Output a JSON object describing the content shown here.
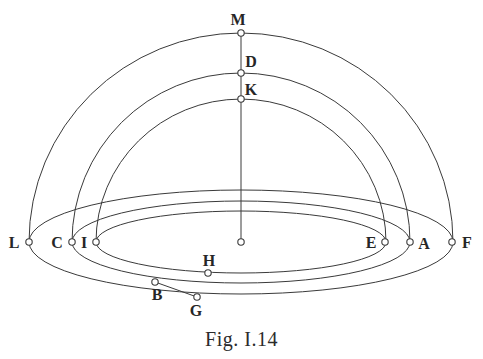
{
  "figure": {
    "caption": "Fig. I.14",
    "type": "geometric-diagram",
    "background_color": "#ffffff",
    "stroke_color": "#3a3a3a",
    "label_color": "#262626",
    "stroke_width": 1,
    "center": {
      "x": 241,
      "y": 242
    },
    "marker": {
      "radius": 3.2,
      "fill": "#ffffff",
      "stroke": "#3a3a3a",
      "stroke_width": 1.1
    },
    "ellipses": [
      {
        "name": "outer-horizon-ellipse",
        "cx": 241,
        "cy": 242,
        "rx": 212,
        "ry": 52
      },
      {
        "name": "middle-horizon-ellipse",
        "cx": 241,
        "cy": 242,
        "rx": 169,
        "ry": 41
      },
      {
        "name": "inner-horizon-ellipse",
        "cx": 241,
        "cy": 242,
        "rx": 145,
        "ry": 31
      }
    ],
    "arcs": [
      {
        "name": "outer-meridian-arc",
        "from": "L",
        "apex": "M",
        "to": "F",
        "cx": 241,
        "cy": 242,
        "r": 209,
        "rx": 212
      },
      {
        "name": "middle-meridian-arc",
        "from": "C",
        "apex": "D",
        "to": "A",
        "cx": 241,
        "cy": 242,
        "r": 169,
        "rx": 169
      },
      {
        "name": "inner-meridian-arc",
        "from": "I",
        "apex": "K",
        "to": "E",
        "cx": 241,
        "cy": 242,
        "r": 143,
        "rx": 145
      }
    ],
    "axis_line": {
      "name": "zenith-axis",
      "x": 241,
      "y1": 33,
      "y2": 242
    },
    "connector_lines": [
      {
        "name": "connector-b-g",
        "x1": 155,
        "y1": 282,
        "x2": 197,
        "y2": 297
      }
    ],
    "points": [
      {
        "id": "M",
        "label": "M",
        "x": 241,
        "y": 33,
        "label_x": 238,
        "label_y": 20
      },
      {
        "id": "D",
        "label": "D",
        "x": 241,
        "y": 73,
        "label_x": 251,
        "label_y": 62
      },
      {
        "id": "K",
        "label": "K",
        "x": 241,
        "y": 99,
        "label_x": 251,
        "label_y": 90
      },
      {
        "id": "O",
        "label": "",
        "x": 241,
        "y": 242,
        "label_x": 241,
        "label_y": 242
      },
      {
        "id": "L",
        "label": "L",
        "x": 29,
        "y": 242,
        "label_x": 14,
        "label_y": 243
      },
      {
        "id": "C",
        "label": "C",
        "x": 72,
        "y": 242,
        "label_x": 57,
        "label_y": 243
      },
      {
        "id": "I",
        "label": "I",
        "x": 96,
        "y": 242,
        "label_x": 84,
        "label_y": 243
      },
      {
        "id": "E",
        "label": "E",
        "x": 385,
        "y": 242,
        "label_x": 371,
        "label_y": 243
      },
      {
        "id": "A",
        "label": "A",
        "x": 410,
        "y": 242,
        "label_x": 424,
        "label_y": 244
      },
      {
        "id": "F",
        "label": "F",
        "x": 452,
        "y": 242,
        "label_x": 467,
        "label_y": 243
      },
      {
        "id": "H",
        "label": "H",
        "x": 208,
        "y": 273,
        "label_x": 209,
        "label_y": 261
      },
      {
        "id": "B",
        "label": "B",
        "x": 155,
        "y": 282,
        "label_x": 157,
        "label_y": 295
      },
      {
        "id": "G",
        "label": "G",
        "x": 197,
        "y": 297,
        "label_x": 196,
        "label_y": 311
      }
    ]
  }
}
